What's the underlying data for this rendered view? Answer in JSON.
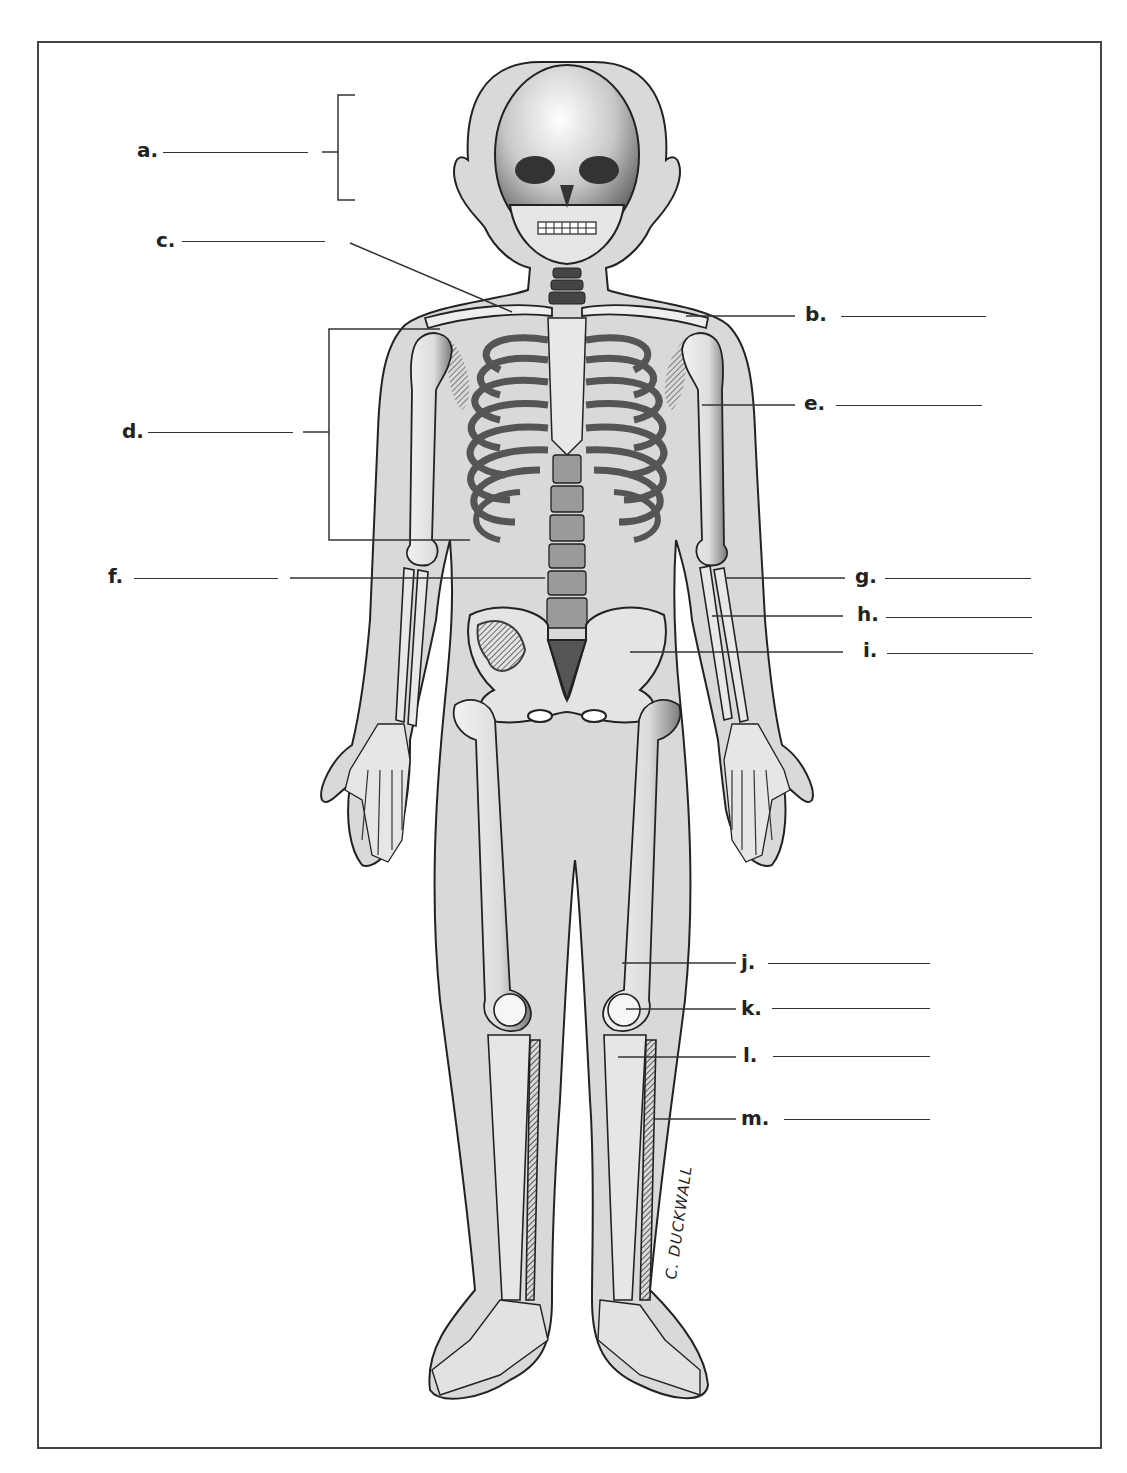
{
  "diagram": {
    "signature": "C. DUCKWALL",
    "colors": {
      "body_fill": "#d9d9d9",
      "bone_fill": "#eeeeee",
      "outline": "#222222",
      "shade": "#555555",
      "background": "#ffffff"
    },
    "labels": [
      {
        "id": "a",
        "text": "a.",
        "side": "left",
        "target": "skull (bracketed region)",
        "answer": ""
      },
      {
        "id": "b",
        "text": "b.",
        "side": "right",
        "target": "clavicle",
        "answer": ""
      },
      {
        "id": "c",
        "text": "c.",
        "side": "left",
        "target": "sternum / manubrium",
        "answer": ""
      },
      {
        "id": "d",
        "text": "d.",
        "side": "left",
        "target": "thoracic cage (bracketed region)",
        "answer": ""
      },
      {
        "id": "e",
        "text": "e.",
        "side": "right",
        "target": "humerus",
        "answer": ""
      },
      {
        "id": "f",
        "text": "f.",
        "side": "left",
        "target": "vertebral column",
        "answer": ""
      },
      {
        "id": "g",
        "text": "g.",
        "side": "right",
        "target": "radius",
        "answer": ""
      },
      {
        "id": "h",
        "text": "h.",
        "side": "right",
        "target": "ulna",
        "answer": ""
      },
      {
        "id": "i",
        "text": "i.",
        "side": "right",
        "target": "pelvis",
        "answer": ""
      },
      {
        "id": "j",
        "text": "j.",
        "side": "right",
        "target": "femur",
        "answer": ""
      },
      {
        "id": "k",
        "text": "k.",
        "side": "right",
        "target": "patella",
        "answer": ""
      },
      {
        "id": "l",
        "text": "l.",
        "side": "right",
        "target": "tibia",
        "answer": ""
      },
      {
        "id": "m",
        "text": "m.",
        "side": "right",
        "target": "fibula",
        "answer": ""
      }
    ]
  }
}
